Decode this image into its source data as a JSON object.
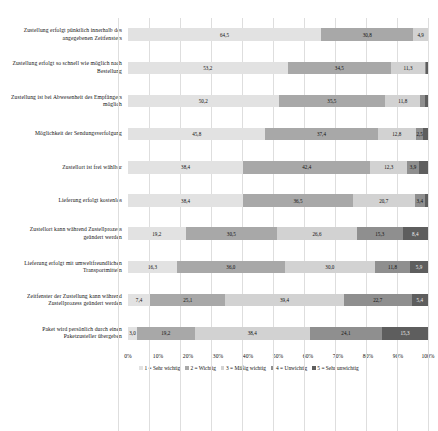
{
  "chart_data": {
    "type": "bar",
    "title": "",
    "subtitle": "",
    "xlabel": "",
    "ylabel": "",
    "orientation": "horizontal",
    "stacked": true,
    "stack_mode": "percent",
    "xlim": [
      0,
      100
    ],
    "grid": true,
    "legend_position": "bottom",
    "tick_labels": [
      "0%",
      "10%",
      "20%",
      "30%",
      "40%",
      "50%",
      "60%",
      "70%",
      "80%",
      "90%",
      "100%"
    ],
    "tick_values": [
      0,
      10,
      20,
      30,
      40,
      50,
      60,
      70,
      80,
      90,
      100
    ],
    "categories": [
      "Zustellung erfolgt pünktlich innerhalb des angegebenen Zeitfensters",
      "Zustellung erfolgt so schnell wie möglich nach Bestellung",
      "Zustellung ist bei Abwesenheit des Empfängers möglich",
      "Möglichkeit der Sendungsverfolgung",
      "Zustellort ist frei wählbar",
      "Lieferung erfolgt kostenlos",
      "Zustellort kann während Zustellprozess geändert werden",
      "Lieferung erfolgt mit umweltfreundlichen Transportmitteln",
      "Zeitfenster der Zustellung kann während Zustellprozess geändert werden",
      "Paket wird persönlich durch einen Paketzusteller übergeben"
    ],
    "series": [
      {
        "name": "1 = Sehr wichtig",
        "color": "#e2e2e2",
        "values": [
          64.5,
          53.2,
          50.2,
          45.8,
          38.4,
          38.4,
          19.2,
          16.3,
          7.4,
          3.0
        ]
      },
      {
        "name": "2 = Wichtig",
        "color": "#a8a8a8",
        "values": [
          30.8,
          34.5,
          35.5,
          37.4,
          42.4,
          36.5,
          30.5,
          36.0,
          25.1,
          19.2
        ]
      },
      {
        "name": "3 = Mäßig wichtig",
        "color": "#d2d2d2",
        "values": [
          4.9,
          11.3,
          11.8,
          12.8,
          12.3,
          20.7,
          26.6,
          30.0,
          39.4,
          38.4
        ]
      },
      {
        "name": "4 = Unwichtig",
        "color": "#8f8f8f",
        "values": [
          0.0,
          0.5,
          1.5,
          2.5,
          3.9,
          3.4,
          15.3,
          11.8,
          22.7,
          24.1
        ]
      },
      {
        "name": "5 = Sehr unwichtig",
        "color": "#5e5e5e",
        "values": [
          0.0,
          0.5,
          1.0,
          1.5,
          3.0,
          1.0,
          8.4,
          5.9,
          5.4,
          15.3
        ]
      }
    ],
    "bar_labels": [
      [
        "64,5",
        "30,8",
        "4,9",
        "",
        ""
      ],
      [
        "53,2",
        "34,5",
        "11,3",
        "",
        ""
      ],
      [
        "50,2",
        "35,5",
        "11,8",
        "",
        ""
      ],
      [
        "45,8",
        "37,4",
        "12,8",
        "2,5",
        ""
      ],
      [
        "38,4",
        "42,4",
        "12,3",
        "3,9",
        ""
      ],
      [
        "38,4",
        "36,5",
        "20,7",
        "3,4",
        ""
      ],
      [
        "19,2",
        "30,5",
        "26,6",
        "15,3",
        "8,4"
      ],
      [
        "16,3",
        "36,0",
        "30,0",
        "11,8",
        "5,9"
      ],
      [
        "7,4",
        "25,1",
        "39,4",
        "22,7",
        "5,4"
      ],
      [
        "3,0",
        "19,2",
        "38,4",
        "24,1",
        "15,3"
      ]
    ]
  }
}
